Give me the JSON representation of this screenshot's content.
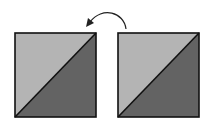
{
  "diagram": {
    "colors": {
      "light": "#b4b4b4",
      "dark": "#636363",
      "outline": "#111111",
      "background": "#ffffff"
    },
    "blocks": [
      {
        "id": "left-block",
        "x": 15,
        "y": 33,
        "size": 81
      },
      {
        "id": "right-block",
        "x": 118,
        "y": 33,
        "size": 81
      }
    ],
    "arrow": {
      "direction": "right-to-left",
      "shape": "curved"
    }
  }
}
